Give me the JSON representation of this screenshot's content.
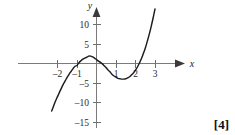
{
  "figure": {
    "marks_badge": "[4]",
    "axis_labels": {
      "x": "x",
      "y": "y"
    }
  },
  "chart_data": {
    "type": "line",
    "title": "",
    "subtitle": "",
    "xlabel": "x",
    "ylabel": "y",
    "xlim": [
      -2.6,
      3.9
    ],
    "ylim": [
      -16.5,
      13.5
    ],
    "grid": false,
    "legend": null,
    "legend_position": "none",
    "annotations": [],
    "x_ticks": [
      -2,
      -1,
      1,
      2,
      3
    ],
    "x_tick_labels": [
      "–2",
      "–1",
      "1",
      "2",
      "3"
    ],
    "y_ticks": [
      10,
      5,
      -5,
      -10,
      -15
    ],
    "y_tick_labels": [
      "10",
      "5",
      "–5",
      "–10",
      "–15"
    ],
    "curve_expression": "y = x^3 - 1.5x^2 - 3x + 1",
    "roots_x": [
      -1.4,
      0.31,
      2.86
    ],
    "local_maximum": {
      "x": -0.64,
      "y": 3.1
    },
    "local_minimum": {
      "x": 1.56,
      "y": -4.0
    },
    "x": [
      -2.3,
      -2.2,
      -2.1,
      -2.0,
      -1.9,
      -1.8,
      -1.7,
      -1.6,
      -1.5,
      -1.4,
      -1.3,
      -1.2,
      -1.1,
      -1.0,
      -0.9,
      -0.8,
      -0.7,
      -0.6,
      -0.5,
      -0.4,
      -0.3,
      -0.2,
      -0.1,
      0.0,
      0.1,
      0.2,
      0.3,
      0.4,
      0.5,
      0.6,
      0.7,
      0.8,
      0.9,
      1.0,
      1.1,
      1.2,
      1.3,
      1.4,
      1.5,
      1.6,
      1.7,
      1.8,
      1.9,
      2.0,
      2.1,
      2.2,
      2.3,
      2.4,
      2.5,
      2.6,
      2.7,
      2.8,
      2.9,
      3.0,
      3.1,
      3.2,
      3.3,
      3.4,
      3.5
    ],
    "y": [
      -12.2,
      -10.9,
      -9.6,
      -8.5,
      -7.4,
      -6.3,
      -5.3,
      -4.4,
      -3.5,
      -2.7,
      -2.0,
      -1.3,
      -0.7,
      -0.5,
      0.2,
      0.7,
      1.1,
      1.4,
      1.6,
      1.9,
      1.9,
      1.7,
      1.4,
      1.0,
      0.6,
      0.3,
      -0.1,
      -0.6,
      -1.1,
      -1.7,
      -2.2,
      -2.8,
      -3.2,
      -3.5,
      -3.8,
      -3.9,
      -4.0,
      -4.0,
      -3.9,
      -3.7,
      -3.4,
      -2.9,
      -2.4,
      -1.7,
      -0.9,
      0.1,
      1.2,
      2.5,
      3.9,
      5.6,
      7.4,
      9.4,
      11.6,
      14.0,
      16.6,
      19.4,
      22.4,
      25.6,
      29.1
    ]
  }
}
